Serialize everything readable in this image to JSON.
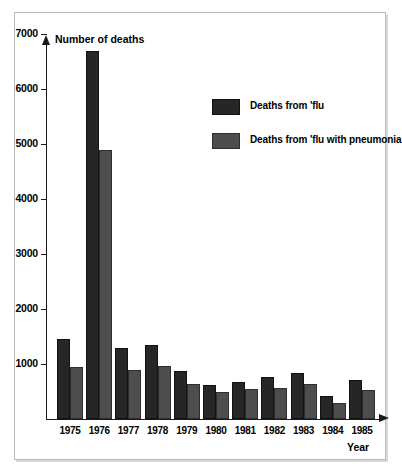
{
  "chart_data": {
    "type": "bar",
    "title": "",
    "ylabel": "Number of deaths",
    "xlabel": "Year",
    "categories": [
      "1975",
      "1976",
      "1977",
      "1978",
      "1979",
      "1980",
      "1981",
      "1982",
      "1983",
      "1984",
      "1985"
    ],
    "series": [
      {
        "name": "Deaths from 'flu",
        "color": "#262626",
        "values": [
          1450,
          6700,
          1300,
          1350,
          870,
          620,
          680,
          760,
          830,
          420,
          710
        ]
      },
      {
        "name": "Deaths from 'flu with pneumonia",
        "color": "#4d4d4d",
        "values": [
          950,
          4900,
          900,
          960,
          640,
          500,
          540,
          570,
          640,
          300,
          520
        ]
      }
    ],
    "ylim": [
      0,
      7400
    ],
    "y_ticks": [
      "1000",
      "2000",
      "3000",
      "4000",
      "5000",
      "6000",
      "7000"
    ],
    "y_tick_values": [
      1000,
      2000,
      3000,
      4000,
      5000,
      6000,
      7000
    ],
    "grid": false,
    "legend_position": "upper-right"
  },
  "axes": {
    "y_title": "Number of deaths",
    "x_title": "Year"
  },
  "legend": {
    "entries": [
      {
        "label": "Deaths from 'flu",
        "swatch": "black-swatch"
      },
      {
        "label": "Deaths from 'flu with pneumonia",
        "swatch": "grey-swatch"
      }
    ]
  }
}
